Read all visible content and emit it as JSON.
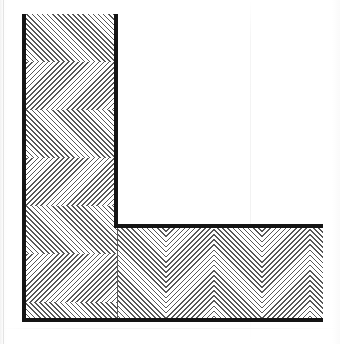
{
  "drawing": {
    "title": "Wall Corner Section Detail",
    "description": "Scanned architectural line drawing of an L-shaped wall corner shown in cut section, with herringbone dotted hatching indicating the cut material.",
    "medium": "scanned line drawing",
    "canvas": {
      "width": 340,
      "height": 344,
      "background": "#ffffff"
    }
  },
  "colors": {
    "section_outline": "#141414",
    "hatch": "#282828",
    "joint_line": "#5a5a5a",
    "paper": "#ffffff",
    "page_edge": "#e8e8e8"
  },
  "members": [
    {
      "id": "vertical-wall",
      "label": "Vertical wall leg",
      "orientation": "vertical",
      "hatch_pattern": "herringbone-dotted-diagonal",
      "x": 23,
      "y": 14,
      "width": 95,
      "height": 308
    },
    {
      "id": "horizontal-wall",
      "label": "Horizontal wall leg",
      "orientation": "horizontal",
      "hatch_pattern": "herringbone-dotted-diagonal",
      "x": 118,
      "y": 227,
      "width": 205,
      "height": 95
    }
  ],
  "section_lines": [
    {
      "id": "left-outer-edge",
      "label": "Left outer face of vertical wall",
      "x": 22,
      "y": 14,
      "width": 4,
      "height": 308
    },
    {
      "id": "right-inner-edge",
      "label": "Right inner face of vertical wall",
      "x": 114,
      "y": 14,
      "width": 4,
      "height": 214
    },
    {
      "id": "top-inner-edge",
      "label": "Upper inner face of horizontal wall",
      "x": 114,
      "y": 224,
      "width": 209,
      "height": 4
    },
    {
      "id": "bottom-outer-edge",
      "label": "Bottom outer face",
      "x": 22,
      "y": 318,
      "width": 301,
      "height": 4
    }
  ],
  "joint_lines": [
    {
      "id": "corner-mitre-joint",
      "label": "Mitre joint between wall legs",
      "x": 117,
      "y": 228,
      "width": 1,
      "height": 92
    }
  ],
  "scan_artifacts": {
    "vertical_streak_x": 250,
    "horizontal_streak_y": 328,
    "page_edge_left_x": 3
  },
  "annotations": []
}
